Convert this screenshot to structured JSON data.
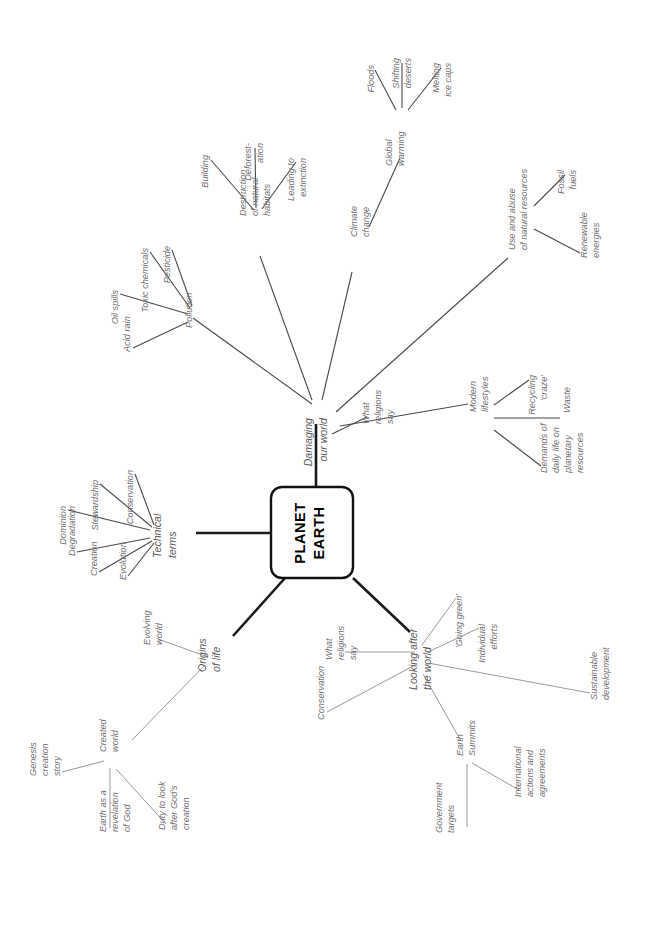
{
  "diagram": {
    "type": "mind-map",
    "orientation": "rotated-90-ccw",
    "title": "PLANET EARTH",
    "center": {
      "line1": "PLANET",
      "line2": "EARTH"
    },
    "colors": {
      "edge": "#4a4a4a",
      "edge_faint": "#9a9a9a",
      "trunk": "#1a1a1a",
      "text": "#6f6f6f",
      "center_text": "#000000",
      "background": "#ffffff"
    },
    "branches": [
      {
        "id": "damaging-our-world",
        "label": "Damaging our world",
        "label_lines": [
          "Damaging",
          "our world"
        ],
        "children": [
          {
            "id": "pollution",
            "label": "Pollution",
            "label_lines": [
              "Pollution"
            ],
            "children": [
              {
                "id": "acid-rain",
                "label": "Acid rain",
                "label_lines": [
                  "Acid rain"
                ]
              },
              {
                "id": "oil-spills",
                "label": "Oil spills",
                "label_lines": [
                  "Oil spills"
                ]
              },
              {
                "id": "toxic-chemicals",
                "label": "Toxic chemicals",
                "label_lines": [
                  "Toxic chemicals"
                ]
              },
              {
                "id": "pesticide",
                "label": "Pesticide",
                "label_lines": [
                  "Pesticide"
                ]
              }
            ]
          },
          {
            "id": "destruction-of-natural-habitats",
            "label": "Destruction of natural habitats",
            "label_lines": [
              "Destruction",
              "of natural",
              "habitats"
            ],
            "children": [
              {
                "id": "building",
                "label": "Building",
                "label_lines": [
                  "Building"
                ]
              },
              {
                "id": "deforestation",
                "label": "Deforest-ation",
                "label_lines": [
                  "Deforest-",
                  "ation"
                ]
              },
              {
                "id": "leading-to-extinction",
                "label": "Leading to extinction",
                "label_lines": [
                  "Leading to",
                  "extinction"
                ]
              }
            ]
          },
          {
            "id": "climate-change",
            "label": "Climate change",
            "label_lines": [
              "Climate",
              "change"
            ],
            "children": [
              {
                "id": "global-warming",
                "label": "Global warming",
                "label_lines": [
                  "Global",
                  "warming"
                ],
                "children": [
                  {
                    "id": "floods",
                    "label": "Floods",
                    "label_lines": [
                      "Floods"
                    ]
                  },
                  {
                    "id": "shifting-deserts",
                    "label": "Shifting deserts",
                    "label_lines": [
                      "Shifting",
                      "deserts"
                    ]
                  },
                  {
                    "id": "melting-ice-caps",
                    "label": "Melting ice caps",
                    "label_lines": [
                      "Melting",
                      "ice caps"
                    ]
                  }
                ]
              }
            ]
          },
          {
            "id": "use-and-abuse-of-natural-resources",
            "label": "Use and abuse of natural resources",
            "label_lines": [
              "Use and abuse",
              "of natural resources"
            ],
            "children": [
              {
                "id": "fossil-fuels",
                "label": "Fossil fuels",
                "label_lines": [
                  "Fossil",
                  "fuels"
                ]
              },
              {
                "id": "renewable-energies",
                "label": "Renewable energies",
                "label_lines": [
                  "Renewable",
                  "energies"
                ]
              }
            ]
          },
          {
            "id": "modern-lifestyles",
            "label": "Modern lifestyles",
            "label_lines": [
              "Modern",
              "lifestyles"
            ],
            "children": [
              {
                "id": "recycling-craze",
                "label": "Recycling 'craze'",
                "label_lines": [
                  "Recycling",
                  "'craze'"
                ]
              },
              {
                "id": "waste",
                "label": "Waste",
                "label_lines": [
                  "Waste"
                ]
              },
              {
                "id": "demands-of-daily-life",
                "label": "Demands of daily life on planetary resources",
                "label_lines": [
                  "Demands of",
                  "daily life on",
                  "planetary",
                  "resources"
                ]
              }
            ]
          },
          {
            "id": "what-religions-say-damaging",
            "label": "What religions say",
            "label_lines": [
              "What",
              "religions",
              "say"
            ]
          }
        ]
      },
      {
        "id": "technical-terms",
        "label": "Technical terms",
        "label_lines": [
          "Technical",
          "terms"
        ],
        "children": [
          {
            "id": "conservation-tt",
            "label": "Conservation",
            "label_lines": [
              "Conservation"
            ]
          },
          {
            "id": "stewardship",
            "label": "Stewardship",
            "label_lines": [
              "Stewardship"
            ]
          },
          {
            "id": "dominion",
            "label": "Dominion",
            "label_lines": [
              "Dominion"
            ]
          },
          {
            "id": "degradation",
            "label": "Degradation",
            "label_lines": [
              "Degradation"
            ]
          },
          {
            "id": "creation",
            "label": "Creation",
            "label_lines": [
              "Creation"
            ]
          },
          {
            "id": "evolution",
            "label": "Evolution",
            "label_lines": [
              "Evolution"
            ]
          }
        ]
      },
      {
        "id": "origins-of-life",
        "label": "Origins of life",
        "label_lines": [
          "Origins",
          "of life"
        ],
        "children": [
          {
            "id": "evolving-world",
            "label": "Evolving world",
            "label_lines": [
              "Evolving",
              "world"
            ]
          },
          {
            "id": "created-world",
            "label": "Created world",
            "label_lines": [
              "Created",
              "world"
            ],
            "children": [
              {
                "id": "genesis-creation-story",
                "label": "Genesis creation story",
                "label_lines": [
                  "Genesis",
                  "creation",
                  "story"
                ]
              },
              {
                "id": "earth-as-a-revelation-of-god",
                "label": "Earth as a revelation of God",
                "label_lines": [
                  "Earth as a",
                  "revelation",
                  "of God"
                ]
              },
              {
                "id": "duty-to-look-after-gods-creation",
                "label": "Duty to look after God's creation",
                "label_lines": [
                  "Duty to look",
                  "after God's",
                  "creation"
                ]
              }
            ]
          }
        ]
      },
      {
        "id": "looking-after-the-world",
        "label": "Looking after the world",
        "label_lines": [
          "Looking after",
          "the world"
        ],
        "children": [
          {
            "id": "what-religions-say-looking",
            "label": "What religions say",
            "label_lines": [
              "What",
              "religions",
              "say"
            ]
          },
          {
            "id": "conservation-looking",
            "label": "Conservation",
            "label_lines": [
              "Conservation"
            ]
          },
          {
            "id": "going-green",
            "label": "'Going green'",
            "label_lines": [
              "'Going green'"
            ]
          },
          {
            "id": "individual-efforts",
            "label": "Individual efforts",
            "label_lines": [
              "Individual",
              "efforts"
            ]
          },
          {
            "id": "sustainable-development",
            "label": "Sustainable development",
            "label_lines": [
              "Sustainable",
              "development"
            ]
          },
          {
            "id": "earth-summits",
            "label": "Earth Summits",
            "label_lines": [
              "Earth",
              "Summits"
            ],
            "children": [
              {
                "id": "government-targets",
                "label": "Government targets",
                "label_lines": [
                  "Government",
                  "targets"
                ]
              },
              {
                "id": "international-actions-and-agreements",
                "label": "International actions and agreements",
                "label_lines": [
                  "International",
                  "actions and",
                  "agreements"
                ]
              }
            ]
          }
        ]
      }
    ]
  }
}
